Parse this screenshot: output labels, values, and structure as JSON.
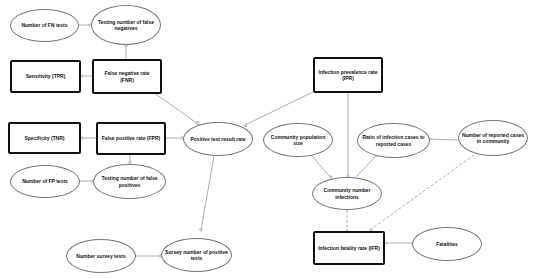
{
  "nodes": {
    "fn_tests": "Number of FN tests",
    "testing_false_negatives": "Testing number of false negatives",
    "sensitivity": "Sensitivity (TPR)",
    "fnr": "False negative rate (FNR)",
    "specificity": "Specificity (TNR)",
    "fpr": "False positive rate (FPR)",
    "fp_tests": "Number of  FP tests",
    "testing_false_positives": "Testing number of false positives",
    "positive_test_result_rate": "Positive test result rate",
    "ipr": "Infection prevalence rate (IPR)",
    "community_population_size": "Community population size",
    "ratio_infection_reported": "Ratio of infection cases to reported cases",
    "reported_cases_community": "Number of reported cases in community",
    "community_number_infections": "Community number infections",
    "number_survey_tests": "Number survey tests",
    "survey_positive_tests": "Survey number of positive tests",
    "ifr": "Infection fatality rate (IFR)",
    "fatalities": "Fatalities"
  },
  "colors": {
    "edge": "#999999",
    "rect_border": "#111111",
    "ellipse_border": "#777777"
  }
}
